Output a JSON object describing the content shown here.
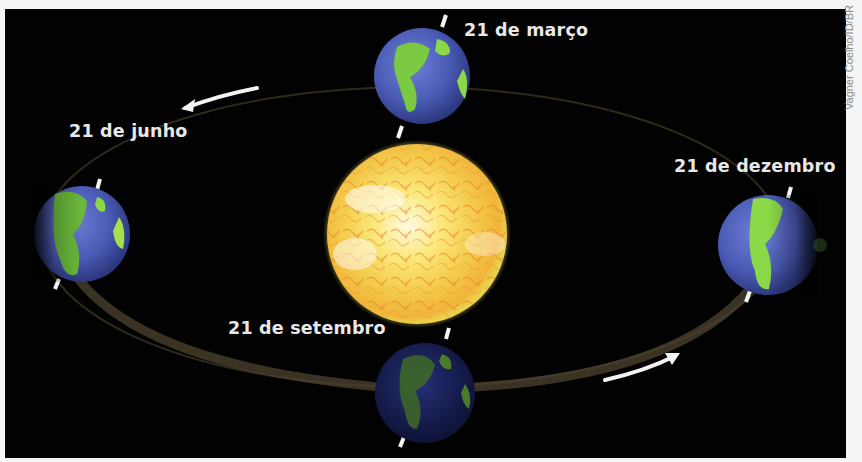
{
  "diagram": {
    "background_color": "#020202",
    "sun": {
      "label": "Sol",
      "color": "#f2d33a"
    },
    "orbit": {
      "color": "#5a4e30",
      "direction": "counter-clockwise (arrows)"
    },
    "positions": [
      {
        "id": "march",
        "label": "21 de março",
        "position": "top"
      },
      {
        "id": "june",
        "label": "21 de junho",
        "position": "left"
      },
      {
        "id": "september",
        "label": "21 de setembro",
        "position": "bottom"
      },
      {
        "id": "december",
        "label": "21 de dezembro",
        "position": "right"
      }
    ],
    "arrows": [
      {
        "id": "top-left-arrow",
        "direction": "left"
      },
      {
        "id": "bottom-right-arrow",
        "direction": "right"
      }
    ],
    "credit": "Vagner Coelho/ID/BR"
  }
}
